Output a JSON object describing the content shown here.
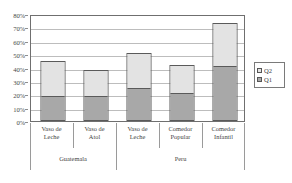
{
  "chart_data": {
    "type": "bar",
    "subtype": "stacked-bar",
    "title": "",
    "xlabel": "",
    "ylabel": "",
    "ylim": [
      0,
      80
    ],
    "ytick_values": [
      0,
      10,
      20,
      30,
      40,
      50,
      60,
      70,
      80
    ],
    "ytick_labels": [
      "0%",
      "10%",
      "20%",
      "30%",
      "40%",
      "50%",
      "60%",
      "70%",
      "80%"
    ],
    "grid": true,
    "grid_axis": "y",
    "legend_position": "right",
    "categories": [
      "Vaso de Leche",
      "Vaso de Atol",
      "Vaso de Leche",
      "Comedor Popular",
      "Comedor Infantil"
    ],
    "category_lines": [
      [
        "Vaso de",
        "Leche"
      ],
      [
        "Vaso de",
        "Atol"
      ],
      [
        "Vaso de",
        "Leche"
      ],
      [
        "Comedor",
        "Popular"
      ],
      [
        "Comedor",
        "Infantil"
      ]
    ],
    "groups": [
      {
        "label": "Guatemala",
        "categories": [
          "Vaso de Leche",
          "Vaso de Atol"
        ]
      },
      {
        "label": "Peru",
        "categories": [
          "Vaso de Leche",
          "Comedor Popular",
          "Comedor Infantil"
        ]
      }
    ],
    "series": [
      {
        "name": "Q1",
        "color": "#a8a8a8",
        "values": [
          19,
          19,
          25,
          21,
          42
        ]
      },
      {
        "name": "Q2",
        "color": "#e3e3e3",
        "values": [
          27,
          20,
          27,
          22,
          33
        ]
      }
    ],
    "totals": [
      46,
      39,
      52,
      43,
      75
    ],
    "stack_order_bottom_to_top": [
      "Q1",
      "Q2"
    ]
  },
  "legend": {
    "entries": [
      {
        "label": "Q2",
        "color": "#e3e3e3"
      },
      {
        "label": "Q1",
        "color": "#a8a8a8"
      }
    ]
  }
}
